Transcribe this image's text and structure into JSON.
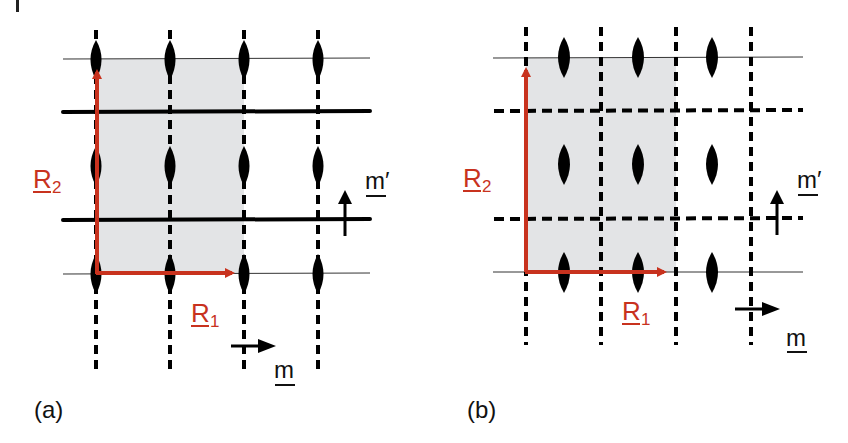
{
  "figure": {
    "colors": {
      "vector": "#c8321e",
      "cell_fill": "#e3e4e6",
      "line": "#000000",
      "background": "#ffffff"
    },
    "panels": [
      {
        "id": "a",
        "caption": "(a)",
        "labels": {
          "r1": "R",
          "r1_sub": "1",
          "r2": "R",
          "r2_sub": "2",
          "m": "m",
          "m_prime": "m′"
        },
        "mirror_lines": "vertical dashed (glide) lines through motifs; horizontal solid mirror lines between rows",
        "motifs_per_row": 4,
        "rows": 3
      },
      {
        "id": "b",
        "caption": "(b)",
        "labels": {
          "r1": "R",
          "r1_sub": "1",
          "r2": "R",
          "r2_sub": "2",
          "m": "m",
          "m_prime": "m′"
        },
        "mirror_lines": "vertical and horizontal dashed (glide) lines between motifs",
        "motifs_per_row": 3,
        "rows": 3
      }
    ]
  }
}
